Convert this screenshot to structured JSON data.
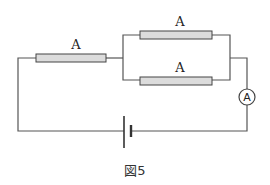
{
  "figure": {
    "caption": "図5",
    "resistors": [
      {
        "id": "series",
        "label": "A"
      },
      {
        "id": "parallel-top",
        "label": "A"
      },
      {
        "id": "parallel-bottom",
        "label": "A"
      }
    ],
    "ammeter": {
      "symbol": "A"
    },
    "battery": {
      "symbol": "cell"
    },
    "colors": {
      "wire": "#555555",
      "resistor_fill": "#dcdcdc",
      "resistor_stroke": "#444444"
    }
  }
}
